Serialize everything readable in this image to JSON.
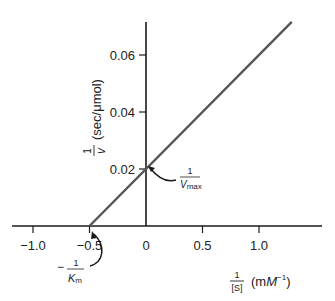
{
  "chart_data": {
    "type": "line",
    "title": "",
    "xlabel": {
      "fraction_numerator": "1",
      "fraction_denominator": "[S]",
      "unit_prefix": "(m",
      "unit_M": "M",
      "unit_exp": "−1",
      "unit_suffix": ")"
    },
    "ylabel": {
      "fraction_numerator": "1",
      "fraction_denominator": "v",
      "unit": "(sec/μmol)"
    },
    "xlim": [
      -1.2,
      1.4
    ],
    "ylim": [
      0,
      0.072
    ],
    "x_ticks": [
      {
        "value": -1.0,
        "label": "−1.0"
      },
      {
        "value": -0.5,
        "label": "−0.5"
      },
      {
        "value": 0,
        "label": "0"
      },
      {
        "value": 0.5,
        "label": "0.5"
      },
      {
        "value": 1.0,
        "label": "1.0"
      }
    ],
    "y_ticks": [
      {
        "value": 0.02,
        "label": "0.02"
      },
      {
        "value": 0.04,
        "label": "0.04"
      },
      {
        "value": 0.06,
        "label": "0.06"
      }
    ],
    "grid": false,
    "series": [
      {
        "name": "Lineweaver-Burk plot",
        "color": "#555555",
        "x": [
          -0.5,
          1.29
        ],
        "y": [
          0,
          0.0716
        ]
      }
    ],
    "annotations": [
      {
        "name": "y-intercept",
        "point": [
          0,
          0.02
        ],
        "numerator": "1",
        "denominator_base": "V",
        "denominator_sub": "max"
      },
      {
        "name": "x-intercept",
        "point": [
          -0.5,
          0
        ],
        "prefix": "−",
        "numerator": "1",
        "denominator_base": "K",
        "denominator_sub": "m"
      }
    ]
  }
}
